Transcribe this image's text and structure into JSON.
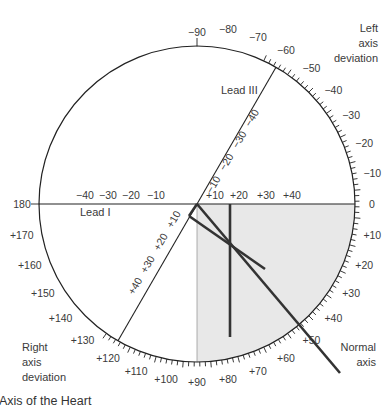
{
  "diagram": {
    "caption": "Axis of the Heart",
    "center": {
      "x": 197,
      "y": 204
    },
    "radius": 158,
    "colors": {
      "circle": "#222222",
      "normal_quadrant_fill": "#e8e8e8",
      "axis_lines": "#333333",
      "text": "#3a3a3a"
    },
    "normal_quadrant": {
      "from_deg": 0,
      "to_deg": 90
    },
    "outer_scale": {
      "tick_range_deg": [
        -65,
        125
      ],
      "minor_step": 2,
      "major_step": 10,
      "labels": [
        {
          "deg": -90,
          "text": "−90"
        },
        {
          "deg": -80,
          "text": "−80"
        },
        {
          "deg": -70,
          "text": "−70"
        },
        {
          "deg": -60,
          "text": "−60"
        },
        {
          "deg": -50,
          "text": "−50"
        },
        {
          "deg": -40,
          "text": "−40"
        },
        {
          "deg": -30,
          "text": "−30"
        },
        {
          "deg": -20,
          "text": "−20"
        },
        {
          "deg": -10,
          "text": "−10"
        },
        {
          "deg": 0,
          "text": "0"
        },
        {
          "deg": 10,
          "text": "+10"
        },
        {
          "deg": 20,
          "text": "+20"
        },
        {
          "deg": 30,
          "text": "+30"
        },
        {
          "deg": 40,
          "text": "+40"
        },
        {
          "deg": 50,
          "text": "+50"
        },
        {
          "deg": 60,
          "text": "+60"
        },
        {
          "deg": 70,
          "text": "+70"
        },
        {
          "deg": 80,
          "text": "+80"
        },
        {
          "deg": 90,
          "text": "+90"
        },
        {
          "deg": 100,
          "text": "+100"
        },
        {
          "deg": 110,
          "text": "+110"
        },
        {
          "deg": 120,
          "text": "+120"
        },
        {
          "deg": 130,
          "text": "+130"
        },
        {
          "deg": 140,
          "text": "+140"
        },
        {
          "deg": 150,
          "text": "+150"
        },
        {
          "deg": 160,
          "text": "+160"
        },
        {
          "deg": 170,
          "text": "+170"
        },
        {
          "deg": 180,
          "text": "180"
        }
      ]
    },
    "lead_I": {
      "label": "Lead I",
      "angle_deg": 0,
      "negative_labels": [
        "−40",
        "−30",
        "−20",
        "−10"
      ],
      "positive_labels": [
        "+10",
        "+20",
        "+30",
        "+40"
      ]
    },
    "lead_III": {
      "label": "Lead III",
      "angle_deg": 120,
      "negative_labels": [
        "−10",
        "−20",
        "−30",
        "−40"
      ],
      "positive_labels": [
        "+10",
        "+20",
        "+30",
        "+40"
      ]
    },
    "region_labels": {
      "left_axis_deviation": [
        "Left",
        "axis",
        "deviation"
      ],
      "right_axis_deviation": [
        "Right",
        "axis",
        "deviation"
      ],
      "normal_axis": [
        "Normal",
        "axis"
      ]
    },
    "vectors": [
      {
        "name": "lead-I-component",
        "x1": 230,
        "y1": 204,
        "x2": 230,
        "y2": 337
      },
      {
        "name": "lead-III-component",
        "x1": 189,
        "y1": 216,
        "x2": 265,
        "y2": 269
      },
      {
        "name": "connector",
        "x1": 189,
        "y1": 216,
        "x2": 197,
        "y2": 204
      },
      {
        "name": "resultant-axis",
        "x1": 197,
        "y1": 204,
        "x2": 340,
        "y2": 373
      }
    ]
  }
}
